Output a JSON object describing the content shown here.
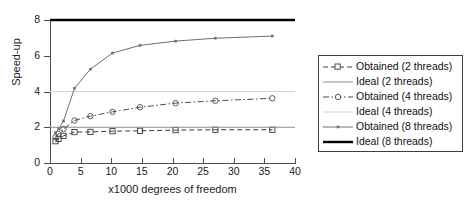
{
  "chart_data": {
    "type": "line",
    "title": "",
    "xlabel": "x1000 degrees of freedom",
    "ylabel": "Speed-up",
    "xlim": [
      0,
      40
    ],
    "ylim": [
      0,
      8
    ],
    "xticks": [
      0,
      5,
      10,
      15,
      20,
      25,
      30,
      35,
      40
    ],
    "yticks": [
      0,
      2,
      4,
      6,
      8
    ],
    "grid": false,
    "legend_position": "right-outside",
    "series": [
      {
        "name": "Obtained (2 threads)",
        "style": "dashed",
        "marker": "square",
        "color": "#3a3a3a",
        "x": [
          0.9,
          1.4,
          2.2,
          4.0,
          6.6,
          10.2,
          14.7,
          20.5,
          27.0,
          36.3
        ],
        "y": [
          1.22,
          1.35,
          1.52,
          1.73,
          1.74,
          1.78,
          1.8,
          1.84,
          1.86,
          1.86
        ]
      },
      {
        "name": "Ideal (2 threads)",
        "style": "solid",
        "marker": "none",
        "color": "#8c8c8c",
        "x": [
          0,
          40
        ],
        "y": [
          2,
          2
        ]
      },
      {
        "name": "Obtained (4 threads)",
        "style": "dashdot",
        "marker": "circle",
        "color": "#4a4a4a",
        "x": [
          0.9,
          1.4,
          2.2,
          4.0,
          6.6,
          10.2,
          14.7,
          20.5,
          27.0,
          36.3
        ],
        "y": [
          1.45,
          1.62,
          1.9,
          2.38,
          2.62,
          2.86,
          3.12,
          3.35,
          3.48,
          3.62
        ]
      },
      {
        "name": "Ideal (4 threads)",
        "style": "solid",
        "marker": "none",
        "color": "#d4d4d4",
        "x": [
          0,
          40
        ],
        "y": [
          4,
          4
        ]
      },
      {
        "name": "Obtained (8 threads)",
        "style": "solid",
        "marker": "dot",
        "color": "#6e6e6e",
        "x": [
          0.9,
          1.4,
          2.2,
          4.0,
          6.6,
          10.2,
          14.7,
          20.5,
          27.0,
          36.3
        ],
        "y": [
          1.7,
          1.9,
          2.35,
          4.18,
          5.25,
          6.15,
          6.58,
          6.82,
          6.98,
          7.1
        ]
      },
      {
        "name": "Ideal (8 threads)",
        "style": "solid-thick",
        "marker": "none",
        "color": "#000000",
        "x": [
          0,
          40
        ],
        "y": [
          8,
          8
        ]
      }
    ]
  },
  "axes": {
    "ylabel": "Speed-up",
    "xlabel": "x1000 degrees of freedom",
    "ytick_labels": [
      "0",
      "2",
      "4",
      "6",
      "8"
    ],
    "xtick_labels": [
      "0",
      "5",
      "10",
      "15",
      "20",
      "25",
      "30",
      "35",
      "40"
    ]
  },
  "legend": {
    "items": [
      {
        "label": "Obtained (2 threads)",
        "series_index": 0
      },
      {
        "label": "Ideal (2 threads)",
        "series_index": 1
      },
      {
        "label": "Obtained (4 threads)",
        "series_index": 2
      },
      {
        "label": "Ideal (4 threads)",
        "series_index": 3
      },
      {
        "label": "Obtained (8 threads)",
        "series_index": 4
      },
      {
        "label": "Ideal (8 threads)",
        "series_index": 5
      }
    ]
  },
  "colors": {
    "axis": "#4d4d4d",
    "ideal2": "#8c8c8c",
    "ideal4": "#d4d4d4",
    "ideal8": "#000000",
    "obtained2": "#3a3a3a",
    "obtained4": "#4a4a4a",
    "obtained8": "#6e6e6e",
    "legend_border": "#3d3d3d",
    "background": "#ffffff"
  }
}
